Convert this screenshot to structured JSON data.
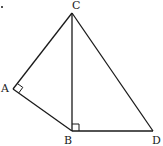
{
  "diagram": {
    "type": "geometry-figure",
    "points": {
      "A": {
        "label": "A",
        "x": 13,
        "y": 89
      },
      "B": {
        "label": "B",
        "x": 72,
        "y": 131
      },
      "C": {
        "label": "C",
        "x": 72,
        "y": 13
      },
      "D": {
        "label": "D",
        "x": 153,
        "y": 131
      }
    },
    "segments": [
      "CA",
      "AB",
      "CB",
      "CD",
      "BD"
    ],
    "right_angles": [
      "A",
      "B"
    ],
    "labels": {
      "A": "A",
      "B": "B",
      "C": "C",
      "D": "D"
    },
    "stroke_color": "#1a1a1a"
  }
}
